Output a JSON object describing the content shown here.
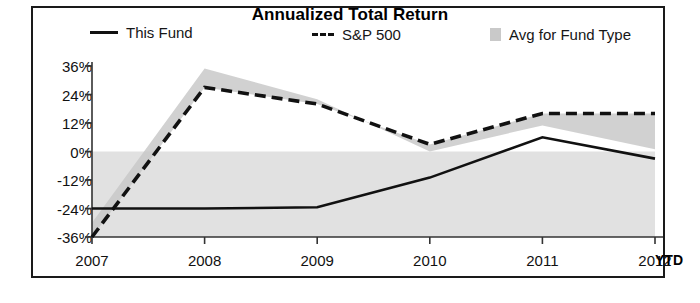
{
  "chart_data": {
    "type": "line",
    "title": "Annualized Total Return",
    "xlabel": "",
    "ylabel": "",
    "categories": [
      "2007",
      "2008",
      "2009",
      "2010",
      "2011",
      "2012"
    ],
    "x_tick_labels": [
      "2007",
      "2008",
      "2009",
      "2010",
      "2011",
      "2012"
    ],
    "x_axis_suffix": "YTD",
    "y_tick_labels": [
      "36%",
      "24%",
      "12%",
      "0%",
      "-12%",
      "-24%",
      "-36%"
    ],
    "y_tick_values": [
      36,
      24,
      12,
      0,
      -12,
      -24,
      -36
    ],
    "ylim": [
      -36,
      36
    ],
    "grid": false,
    "legend_position": "top",
    "series": [
      {
        "name": "This Fund",
        "style": "solid",
        "color": "#111111",
        "values": [
          -24,
          -24,
          -23.5,
          -11,
          6,
          -3
        ]
      },
      {
        "name": "S&P 500",
        "style": "dashed",
        "color": "#111111",
        "values": [
          -36,
          27,
          20,
          3,
          16,
          16
        ]
      },
      {
        "name": "Avg for Fund Type",
        "style": "band",
        "color": "#c9c9c9",
        "values": [
          -30,
          35,
          22,
          0,
          11,
          1
        ]
      }
    ],
    "legend": [
      {
        "label": "This Fund",
        "marker": "solid-line"
      },
      {
        "label": "S&P 500",
        "marker": "dashed-line"
      },
      {
        "label": "Avg for Fund Type",
        "marker": "gray-square"
      }
    ]
  },
  "colors": {
    "line": "#111111",
    "band": "#c9c9c9",
    "frame": "#1a1a1a",
    "background": "#ffffff"
  }
}
